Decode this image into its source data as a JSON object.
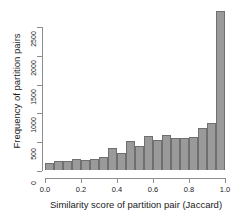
{
  "chart_data": {
    "type": "bar",
    "title": "",
    "subtitle": "",
    "xlabel": "Similarity score of partition pair (Jaccard)",
    "ylabel": "Frequency of partition pairs",
    "grid": false,
    "legend": null,
    "bin_width": 0.05,
    "xlim": [
      0.0,
      1.0
    ],
    "ylim": [
      0,
      2600
    ],
    "xticks": [
      "0.0",
      "0.2",
      "0.4",
      "0.6",
      "0.8",
      "1.0"
    ],
    "xtick_values": [
      0.0,
      0.2,
      0.4,
      0.6,
      0.8,
      1.0
    ],
    "yticks": [
      "0",
      "500",
      "1000",
      "1500",
      "2000",
      "2500"
    ],
    "ytick_values": [
      0,
      500,
      1000,
      1500,
      2000,
      2500
    ],
    "bar_color": "#9a9a9a",
    "bar_border_color": "#6f6f6f",
    "axis_color": "#8d8d8d",
    "categories": [
      "0.00-0.05",
      "0.05-0.10",
      "0.10-0.15",
      "0.15-0.20",
      "0.20-0.25",
      "0.25-0.30",
      "0.30-0.35",
      "0.35-0.40",
      "0.40-0.45",
      "0.45-0.50",
      "0.50-0.55",
      "0.55-0.60",
      "0.60-0.65",
      "0.65-0.70",
      "0.70-0.75",
      "0.75-0.80",
      "0.80-0.85",
      "0.85-0.90",
      "0.90-0.95",
      "0.95-1.00"
    ],
    "bin_centers": [
      0.025,
      0.075,
      0.125,
      0.175,
      0.225,
      0.275,
      0.325,
      0.375,
      0.425,
      0.475,
      0.525,
      0.575,
      0.625,
      0.675,
      0.725,
      0.775,
      0.825,
      0.875,
      0.925,
      0.975
    ],
    "values": [
      120,
      140,
      140,
      185,
      160,
      185,
      215,
      355,
      270,
      475,
      395,
      550,
      495,
      575,
      520,
      525,
      540,
      690,
      760,
      2590
    ]
  }
}
